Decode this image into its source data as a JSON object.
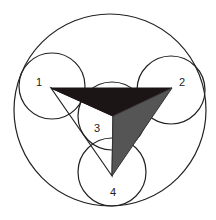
{
  "diagram": {
    "stroke_color": "#222222",
    "outer_circle": {
      "cx": 110,
      "cy": 110,
      "r": 96
    },
    "circles": [
      {
        "id": "1",
        "label": "1",
        "cx": 52,
        "cy": 86,
        "r": 33,
        "label_x": 39,
        "label_y": 86
      },
      {
        "id": "2",
        "label": "2",
        "cx": 171,
        "cy": 90,
        "r": 34,
        "label_x": 182,
        "label_y": 86
      },
      {
        "id": "3",
        "label": "3",
        "cx": 112,
        "cy": 116,
        "r": 34,
        "label_x": 97,
        "label_y": 132
      },
      {
        "id": "4",
        "label": "4",
        "cx": 112,
        "cy": 172,
        "r": 34,
        "label_x": 113,
        "label_y": 196
      }
    ],
    "triangle": {
      "vertices": {
        "v1": [
          51,
          88
        ],
        "v2": [
          172,
          88
        ],
        "center": [
          113,
          116
        ],
        "v4": [
          112,
          176
        ]
      },
      "dark_face_color": "#1c1515",
      "gray_face_color": "#555555",
      "open_face_fill": "none"
    }
  }
}
